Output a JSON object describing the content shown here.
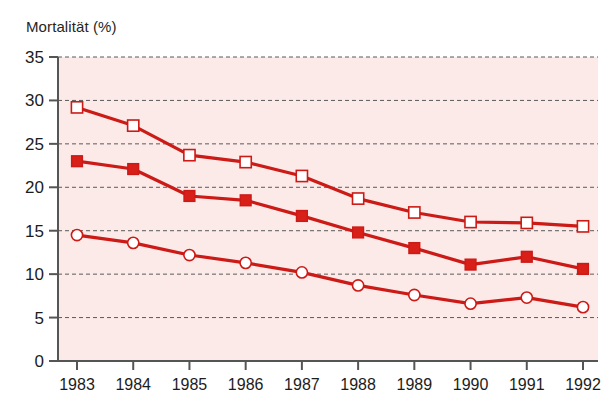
{
  "chart_data": {
    "type": "line",
    "title": "Mortalität (%)",
    "xlabel": "",
    "ylabel": "Mortalität (%)",
    "categories": [
      "1983",
      "1984",
      "1985",
      "1986",
      "1987",
      "1988",
      "1989",
      "1990",
      "1991",
      "1992"
    ],
    "x": [
      1983,
      1984,
      1985,
      1986,
      1987,
      1988,
      1989,
      1990,
      1991,
      1992
    ],
    "ylim": [
      0,
      35
    ],
    "yticks": [
      0,
      5,
      10,
      15,
      20,
      25,
      30,
      35
    ],
    "ytick_labels": [
      "0",
      "5",
      "10",
      "15",
      "20",
      "25",
      "30",
      "35"
    ],
    "grid": true,
    "grid_style": "dashed-horizontal",
    "legend": "none",
    "plot_background_color": "#fbeae8",
    "series": [
      {
        "name": "open-square-series",
        "marker": "open-square",
        "color": "#cc1a16",
        "marker_fill": "#ffffff",
        "values": [
          29.2,
          27.1,
          23.7,
          22.9,
          21.3,
          18.7,
          17.1,
          16.0,
          15.9,
          15.5
        ]
      },
      {
        "name": "filled-square-series",
        "marker": "filled-square",
        "color": "#cc1a16",
        "marker_fill": "#d81f18",
        "values": [
          23.0,
          22.1,
          19.0,
          18.5,
          16.7,
          14.8,
          13.0,
          11.1,
          12.0,
          10.6
        ]
      },
      {
        "name": "open-circle-series",
        "marker": "open-circle",
        "color": "#cc1a16",
        "marker_fill": "#ffffff",
        "values": [
          14.5,
          13.6,
          12.2,
          11.3,
          10.2,
          8.7,
          7.6,
          6.6,
          7.3,
          6.2
        ]
      }
    ]
  },
  "axes": {
    "y_axis_color": "#555555",
    "x_axis_color": "#555555",
    "tick_color": "#555555",
    "gridline_color": "#5a5a5a"
  }
}
